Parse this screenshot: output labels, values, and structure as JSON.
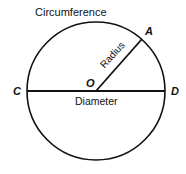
{
  "diagram": {
    "labels": {
      "circumference": "Circumference",
      "radius": "Radius",
      "diameter": "Diameter"
    },
    "points": {
      "center": "O",
      "a": "A",
      "c": "C",
      "d": "D"
    },
    "colors": {
      "stroke": "#111111",
      "background": "#ffffff"
    }
  }
}
